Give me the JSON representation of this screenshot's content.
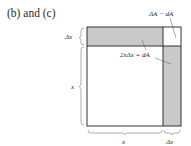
{
  "panel_label": "(b) and (c)",
  "labels": {
    "corner_annotation": "ΔA − dA",
    "strip_annotation": "2xΔx = dA",
    "left_small": "Δx",
    "left_large": "x",
    "bottom_large": "x",
    "bottom_small": "Δx"
  },
  "colors": {
    "strip_fill": "#c9c9c9",
    "edge": "#333333",
    "background": "#ffffff"
  }
}
